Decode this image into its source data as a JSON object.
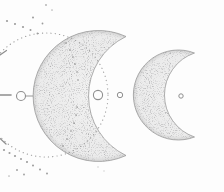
{
  "illustration": {
    "alt": "Stippled pencil line-art of two crescent moons aligned on a horizontal axis, with a dotted orbit circle, scattered dots, small hollow rings and edge tick marks",
    "elements": [
      "axis-dash",
      "axis-ring",
      "axis-connector",
      "large-crescent-moon",
      "small-crescent-moon",
      "orbit-dotted-circle",
      "scatter-dots",
      "center-ring-large",
      "center-ring-small",
      "right-ring",
      "tick-top-left",
      "tick-bottom-left"
    ]
  },
  "colors": {
    "background": "#fdfdfd",
    "outline": "#9a9a9a",
    "moon_base": "#f2f2f2",
    "moon_mid": "#ececec",
    "moon_edge": "#d5d5d5",
    "speckle": "#6e6e6e",
    "dots": "#9c9c9c",
    "body_dots": "#8f8f8f",
    "rings": "#8f8f8f",
    "ticks": "#8d8d8d"
  }
}
